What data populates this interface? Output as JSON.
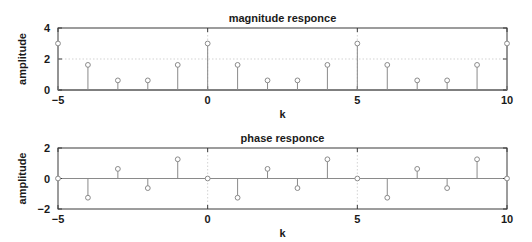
{
  "chart_data": [
    {
      "type": "stem",
      "title": "magnitude responce",
      "xlabel": "k",
      "ylabel": "amplitude",
      "xlim": [
        -5,
        10
      ],
      "ylim": [
        0,
        4
      ],
      "xticks": [
        -5,
        0,
        5,
        10
      ],
      "yticks": [
        0,
        2,
        4
      ],
      "grid": true,
      "x": [
        -5,
        -4,
        -3,
        -2,
        -1,
        0,
        1,
        2,
        3,
        4,
        5,
        6,
        7,
        8,
        9,
        10
      ],
      "values": [
        3.0,
        1.62,
        0.62,
        0.62,
        1.62,
        3.0,
        1.62,
        0.62,
        0.62,
        1.62,
        3.0,
        1.62,
        0.62,
        0.62,
        1.62,
        3.0
      ]
    },
    {
      "type": "stem",
      "title": "phase responce",
      "xlabel": "k",
      "ylabel": "amplitude",
      "xlim": [
        -5,
        10
      ],
      "ylim": [
        -2,
        2
      ],
      "xticks": [
        -5,
        0,
        5,
        10
      ],
      "yticks": [
        -2,
        0,
        2
      ],
      "grid": true,
      "x": [
        -5,
        -4,
        -3,
        -2,
        -1,
        0,
        1,
        2,
        3,
        4,
        5,
        6,
        7,
        8,
        9,
        10
      ],
      "values": [
        0,
        -1.26,
        0.63,
        -0.63,
        1.26,
        0,
        -1.26,
        0.63,
        -0.63,
        1.26,
        0,
        -1.26,
        0.63,
        -0.63,
        1.26,
        0
      ]
    }
  ],
  "layout": {
    "axes": [
      {
        "left": 58,
        "right": 507,
        "top": 28,
        "bottom": 90
      },
      {
        "left": 58,
        "right": 507,
        "top": 148,
        "bottom": 209
      }
    ]
  },
  "colors": {
    "stem": "#8a8a8a",
    "frame": "#3a3a3a",
    "text": "#1a1a1a"
  }
}
